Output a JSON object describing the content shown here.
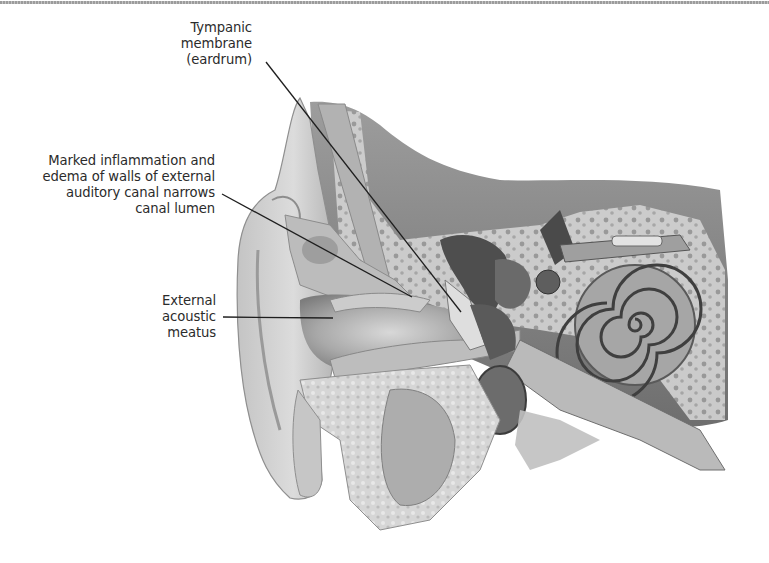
{
  "figure": {
    "style": "grayscale anatomical illustration"
  },
  "labels": [
    {
      "id": "tympanic-membrane",
      "lines": [
        "Tympanic",
        "membrane",
        "(eardrum)"
      ]
    },
    {
      "id": "canal-inflammation",
      "lines": [
        "Marked inflammation and",
        "edema of walls of external",
        "auditory canal narrows",
        "canal lumen"
      ]
    },
    {
      "id": "external-acoustic-meatus",
      "lines": [
        "External",
        "acoustic",
        "meatus"
      ]
    }
  ],
  "colors": {
    "label_text": "#2b2b2b",
    "leader_line": "#1e1e1e",
    "skin": "#c9c9c9",
    "bone": "#bdbdbd",
    "dark_tissue": "#5a5a5a",
    "background": "#ffffff"
  }
}
